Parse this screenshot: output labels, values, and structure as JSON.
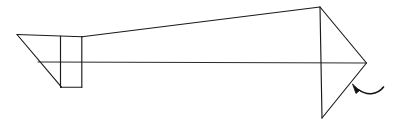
{
  "figure": {
    "background_color": "#ffffff",
    "stroke_color": "#1a1a1a",
    "annotation_color": "#111111",
    "width": 398,
    "height": 127
  },
  "geometry": {
    "left_vertex": {
      "x": 17,
      "y": 34
    },
    "center_axis": {
      "y": 62,
      "x_start": 38,
      "x_end": 366
    },
    "top_edge_left": {
      "x1": 17,
      "y1": 34.5,
      "x2": 82,
      "y2": 37
    },
    "lower_left_diagonal": {
      "x1": 17,
      "y1": 34.5,
      "x2": 61,
      "y2": 87
    },
    "rectangle": {
      "x": 60,
      "y": 36,
      "width": 22,
      "height": 51
    },
    "upper_long_edge": {
      "x1": 82,
      "y1": 37,
      "x2": 320,
      "y2": 7
    },
    "lower_long_edge": {
      "x1": 38,
      "y1": 62,
      "x2": 366,
      "y2": 63
    },
    "arrowhead_top_vertex": {
      "x": 320,
      "y": 7
    },
    "arrowhead_bottom_vertex": {
      "x": 322,
      "y": 118
    },
    "arrowhead_tip": {
      "x": 366,
      "y": 63
    },
    "arrowhead_spine": {
      "x1": 320,
      "y1": 7,
      "x2": 322,
      "y2": 118
    }
  },
  "annotation": {
    "name": "curved-pointer-arrow",
    "description": "Small curved arrow pointing up-left toward the arrowhead",
    "tail": {
      "x": 383,
      "y": 87
    },
    "head": {
      "x": 353,
      "y": 84
    },
    "path": "M 383 87 C 375 95, 364 95, 356 90"
  },
  "labels": {
    "text_items": []
  }
}
